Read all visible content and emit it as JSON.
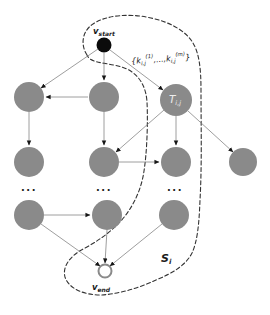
{
  "figure": {
    "background": "#ffffff",
    "colors": {
      "node_fill": "#8a8a8a",
      "start_node_fill": "#0b0b0b",
      "end_node_stroke": "#8a8a8a",
      "edge_stroke": "#7e7e7e",
      "arrowhead": "#161616",
      "region_stroke": "#333333",
      "label_color": "#1a1a1a",
      "task_label_color": "#ededed"
    },
    "labels": {
      "start": {
        "base": "v",
        "sub": "start"
      },
      "end": {
        "base": "v",
        "sub": "end"
      },
      "task": {
        "base": "T",
        "sub": "i,j"
      },
      "region": {
        "base": "S",
        "sub": "i"
      },
      "key_set": {
        "open": "{k",
        "sub1": "i,j",
        "sup1": "(1)",
        "mid": ",...,k",
        "sub2": "i,j",
        "sup2": "(m)",
        "close": "}"
      },
      "ellipsis": "..."
    },
    "structure": {
      "type": "directed-acyclic-graph",
      "description": "DAG from v_start (black node) to v_end (white node); grid of gray task nodes in 4 columns with an ellipsis row; a dashed snake-shaped region S_i encloses v_start, the T_i,j task column and v_end; the edge from v_start toward T_i,j is labeled with the key set {k_i,j(1),...,k_i,j(m)}",
      "gray_node_rows": [
        3,
        4,
        3
      ],
      "ellipsis_columns": 3
    }
  }
}
